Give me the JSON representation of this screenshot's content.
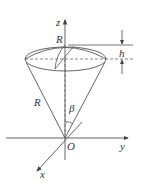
{
  "diagram": {
    "type": "geometry",
    "labels": {
      "z_axis": "z",
      "y_axis": "y",
      "x_axis": "x",
      "origin": "O",
      "radius_top": "R",
      "radius_side": "R",
      "height": "h",
      "angle": "β"
    },
    "colors": {
      "line": "#555555",
      "background": "#ffffff"
    }
  }
}
